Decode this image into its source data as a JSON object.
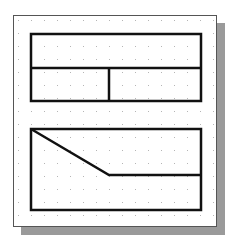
{
  "canvas": {
    "width": 233,
    "height": 246,
    "background": "#ffffff"
  },
  "panel": {
    "x": 13,
    "y": 15,
    "width": 204,
    "height": 212,
    "border_color": "#555555",
    "shadow_color": "#9a9a9a",
    "shadow_offset": 8
  },
  "grid": {
    "dot_color": "#b5b5b5",
    "spacing": 13,
    "origin_x": 18,
    "origin_y": 20
  },
  "stroke": {
    "color": "#111111",
    "width": 2.5
  },
  "shapes": {
    "top_rectangle": {
      "x": 31,
      "y": 34,
      "width": 170,
      "height": 67
    },
    "top_divider_horizontal": {
      "x1": 31,
      "y1": 68,
      "x2": 201,
      "y2": 68
    },
    "top_divider_vertical": {
      "x1": 109,
      "y1": 68,
      "x2": 109,
      "y2": 101
    },
    "bottom_rectangle": {
      "x": 31,
      "y": 129,
      "width": 170,
      "height": 81
    },
    "bottom_polyline": "31,129 109,175 201,175"
  }
}
